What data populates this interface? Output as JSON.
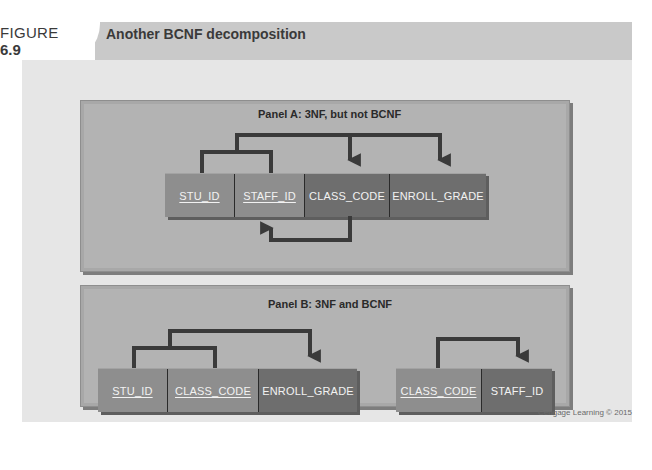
{
  "figure": {
    "label": "FIGURE",
    "number": "6.9",
    "title": "Another BCNF decomposition"
  },
  "panel_a": {
    "title": "Panel A: 3NF, but not BCNF",
    "attributes": [
      {
        "name": "STU_ID",
        "key": true
      },
      {
        "name": "STAFF_ID",
        "key": true
      },
      {
        "name": "CLASS_CODE",
        "key": false
      },
      {
        "name": "ENROLL_GRADE",
        "key": false
      }
    ],
    "dependencies": [
      {
        "from": [
          "STU_ID",
          "STAFF_ID"
        ],
        "to": [
          "CLASS_CODE",
          "ENROLL_GRADE"
        ]
      },
      {
        "from": [
          "CLASS_CODE"
        ],
        "to": [
          "STAFF_ID"
        ]
      }
    ]
  },
  "panel_b": {
    "title": "Panel B: 3NF and BCNF",
    "tables": [
      {
        "attributes": [
          {
            "name": "STU_ID",
            "key": true
          },
          {
            "name": "CLASS_CODE",
            "key": true
          },
          {
            "name": "ENROLL_GRADE",
            "key": false
          }
        ],
        "dependencies": [
          {
            "from": [
              "STU_ID",
              "CLASS_CODE"
            ],
            "to": [
              "ENROLL_GRADE"
            ]
          }
        ]
      },
      {
        "attributes": [
          {
            "name": "CLASS_CODE",
            "key": true
          },
          {
            "name": "STAFF_ID",
            "key": false
          }
        ],
        "dependencies": [
          {
            "from": [
              "CLASS_CODE"
            ],
            "to": [
              "STAFF_ID"
            ]
          }
        ]
      }
    ]
  },
  "credit": "Cengage Learning © 2015",
  "colors": {
    "key_box": "#8e8e8e",
    "nonkey_box": "#6e6e6e",
    "panel": "#b3b3b3",
    "arrow": "#3a3a3a"
  }
}
